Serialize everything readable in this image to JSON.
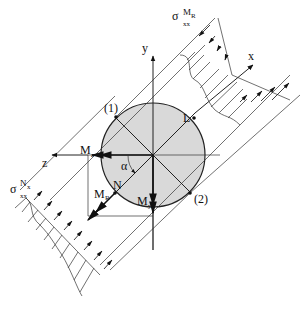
{
  "diagram": {
    "colors": {
      "section_fill": "#d9d9d9",
      "line": "#222222",
      "background": "#ffffff"
    },
    "axes": {
      "x_label": "x",
      "y_label": "y",
      "z_label": "z"
    },
    "points": {
      "p1": "(1)",
      "p2": "(2)",
      "L": "L",
      "N": "N"
    },
    "moments": {
      "Mz": "M",
      "Mz_sub": "z",
      "My": "M",
      "My_sub": "y",
      "MR": "M",
      "MR_sub": "R"
    },
    "angle": {
      "alpha": "α"
    },
    "stress_top": {
      "sigma": "σ",
      "sub": "xx",
      "sup_main": "M",
      "sup_sub": "R"
    },
    "stress_bottom": {
      "sigma": "σ",
      "sub": "xx",
      "sup_main": "N",
      "sup_sub": "x"
    }
  }
}
